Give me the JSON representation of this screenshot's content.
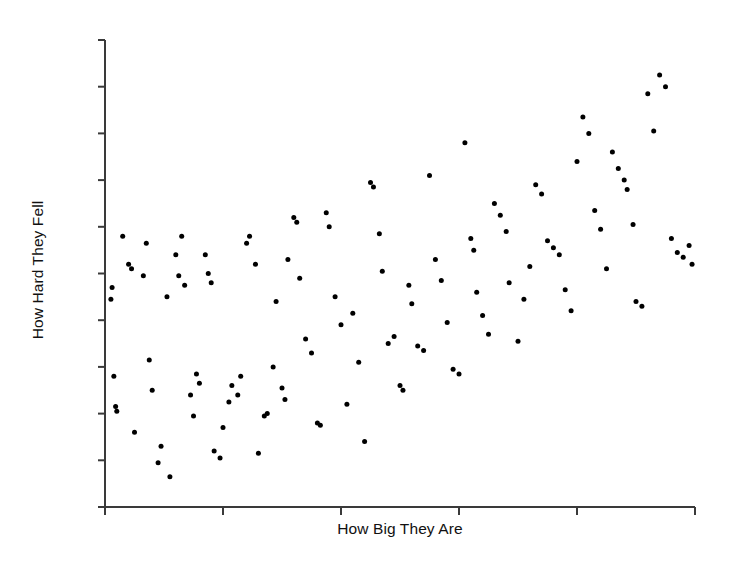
{
  "chart_data": {
    "type": "scatter",
    "title": "",
    "xlabel": "How Big They Are",
    "ylabel": "How Hard They Fell",
    "grid": false,
    "legend": null,
    "xlim": [
      0,
      100
    ],
    "ylim": [
      0,
      100
    ],
    "x_ticks_count": 6,
    "y_ticks_count": 11,
    "tick_labels_shown": false,
    "marker": {
      "shape": "circle",
      "color": "#000000",
      "size_px": 5
    },
    "n_points": 120,
    "points": [
      [
        1.0,
        44.5
      ],
      [
        1.2,
        47.0
      ],
      [
        1.5,
        28.0
      ],
      [
        1.8,
        21.5
      ],
      [
        2.0,
        20.5
      ],
      [
        3.0,
        58.0
      ],
      [
        4.0,
        52.0
      ],
      [
        4.5,
        51.0
      ],
      [
        5.0,
        16.0
      ],
      [
        6.5,
        49.5
      ],
      [
        7.0,
        56.5
      ],
      [
        7.5,
        31.5
      ],
      [
        8.0,
        25.0
      ],
      [
        9.0,
        9.5
      ],
      [
        9.5,
        13.0
      ],
      [
        10.5,
        45.0
      ],
      [
        11.0,
        6.5
      ],
      [
        12.0,
        54.0
      ],
      [
        12.5,
        49.5
      ],
      [
        13.0,
        58.0
      ],
      [
        13.5,
        47.5
      ],
      [
        14.5,
        24.0
      ],
      [
        15.0,
        19.5
      ],
      [
        15.5,
        28.5
      ],
      [
        16.0,
        26.5
      ],
      [
        17.0,
        54.0
      ],
      [
        17.5,
        50.0
      ],
      [
        18.0,
        48.0
      ],
      [
        18.5,
        12.0
      ],
      [
        19.5,
        10.5
      ],
      [
        20.0,
        17.0
      ],
      [
        21.0,
        22.5
      ],
      [
        21.5,
        26.0
      ],
      [
        22.5,
        24.0
      ],
      [
        23.0,
        28.0
      ],
      [
        24.0,
        56.5
      ],
      [
        24.5,
        58.0
      ],
      [
        25.5,
        52.0
      ],
      [
        26.0,
        11.5
      ],
      [
        27.0,
        19.5
      ],
      [
        27.5,
        20.0
      ],
      [
        28.5,
        30.0
      ],
      [
        29.0,
        44.0
      ],
      [
        30.0,
        25.5
      ],
      [
        30.5,
        23.0
      ],
      [
        31.0,
        53.0
      ],
      [
        32.0,
        62.0
      ],
      [
        32.5,
        61.0
      ],
      [
        33.0,
        49.0
      ],
      [
        34.0,
        36.0
      ],
      [
        35.0,
        33.0
      ],
      [
        36.0,
        18.0
      ],
      [
        36.5,
        17.5
      ],
      [
        37.5,
        63.0
      ],
      [
        38.0,
        60.0
      ],
      [
        39.0,
        45.0
      ],
      [
        40.0,
        39.0
      ],
      [
        41.0,
        22.0
      ],
      [
        42.0,
        41.5
      ],
      [
        43.0,
        31.0
      ],
      [
        44.0,
        14.0
      ],
      [
        45.0,
        69.5
      ],
      [
        45.5,
        68.5
      ],
      [
        46.5,
        58.5
      ],
      [
        47.0,
        50.5
      ],
      [
        48.0,
        35.0
      ],
      [
        49.0,
        36.5
      ],
      [
        50.0,
        26.0
      ],
      [
        50.5,
        25.0
      ],
      [
        51.5,
        47.5
      ],
      [
        52.0,
        43.5
      ],
      [
        53.0,
        34.5
      ],
      [
        54.0,
        33.5
      ],
      [
        55.0,
        71.0
      ],
      [
        56.0,
        53.0
      ],
      [
        57.0,
        48.5
      ],
      [
        58.0,
        39.5
      ],
      [
        59.0,
        29.5
      ],
      [
        60.0,
        28.5
      ],
      [
        61.0,
        78.0
      ],
      [
        62.0,
        57.5
      ],
      [
        62.5,
        55.0
      ],
      [
        63.0,
        46.0
      ],
      [
        64.0,
        41.0
      ],
      [
        65.0,
        37.0
      ],
      [
        66.0,
        65.0
      ],
      [
        67.0,
        62.5
      ],
      [
        68.0,
        59.0
      ],
      [
        68.5,
        48.0
      ],
      [
        70.0,
        35.5
      ],
      [
        71.0,
        44.5
      ],
      [
        72.0,
        51.5
      ],
      [
        73.0,
        69.0
      ],
      [
        74.0,
        67.0
      ],
      [
        75.0,
        57.0
      ],
      [
        76.0,
        55.5
      ],
      [
        77.0,
        54.0
      ],
      [
        78.0,
        46.5
      ],
      [
        79.0,
        42.0
      ],
      [
        80.0,
        74.0
      ],
      [
        81.0,
        83.5
      ],
      [
        82.0,
        80.0
      ],
      [
        83.0,
        63.5
      ],
      [
        84.0,
        59.5
      ],
      [
        85.0,
        51.0
      ],
      [
        86.0,
        76.0
      ],
      [
        87.0,
        72.5
      ],
      [
        88.0,
        70.0
      ],
      [
        88.5,
        68.0
      ],
      [
        89.5,
        60.5
      ],
      [
        90.0,
        44.0
      ],
      [
        91.0,
        43.0
      ],
      [
        92.0,
        88.5
      ],
      [
        93.0,
        80.5
      ],
      [
        94.0,
        92.5
      ],
      [
        95.0,
        90.0
      ],
      [
        96.0,
        57.5
      ],
      [
        97.0,
        54.5
      ],
      [
        98.0,
        53.5
      ],
      [
        99.0,
        56.0
      ],
      [
        99.5,
        52.0
      ]
    ]
  },
  "axes": {
    "x_axis_name": "x-axis",
    "y_axis_name": "y-axis",
    "line_color": "#3a3a3a"
  }
}
